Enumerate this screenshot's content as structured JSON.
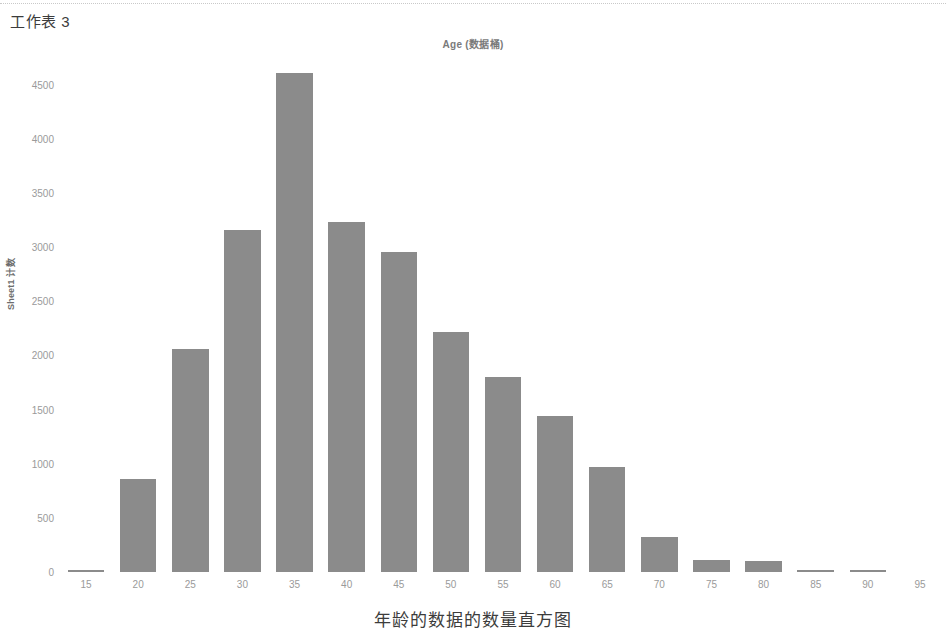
{
  "sheet": {
    "title": "工作表 3"
  },
  "bottom_caption": "年龄的数据的数量直方图",
  "colors": {
    "bar": "#8b8b8b",
    "tick_text": "#9a9a9a",
    "axis_label": "#6d6d6d",
    "title": "#7a7a7a",
    "background": "#ffffff"
  },
  "chart_data": {
    "type": "bar",
    "title": "Age (数据桶)",
    "xlabel": "",
    "ylabel": "Sheet1 计数",
    "categories": [
      15,
      20,
      25,
      30,
      35,
      40,
      45,
      50,
      55,
      60,
      65,
      70,
      75,
      80,
      85,
      90,
      95
    ],
    "values": [
      20,
      860,
      2055,
      3155,
      4610,
      3230,
      2950,
      2215,
      1805,
      1440,
      965,
      320,
      110,
      100,
      20,
      15,
      0
    ],
    "xtick_labels": [
      "15",
      "20",
      "25",
      "30",
      "35",
      "40",
      "45",
      "50",
      "55",
      "60",
      "65",
      "70",
      "75",
      "80",
      "85",
      "90",
      "95"
    ],
    "ytick_labels": [
      "0",
      "500",
      "1000",
      "1500",
      "2000",
      "2500",
      "3000",
      "3500",
      "4000",
      "4500"
    ],
    "ytick_values": [
      0,
      500,
      1000,
      1500,
      2000,
      2500,
      3000,
      3500,
      4000,
      4500
    ],
    "ylim": [
      0,
      4690
    ],
    "grid": false,
    "legend": "none"
  }
}
